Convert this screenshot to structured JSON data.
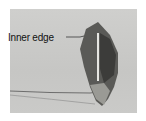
{
  "image": {
    "subject": "fabric piece folded into pointed shape with stitched seam",
    "annotation": {
      "label": "Inner edge"
    },
    "colors": {
      "background": "#c9c9c7",
      "fabric_dark": "#4a4a48",
      "fabric_light": "#8e8e8a",
      "seam": "#e8e8e4",
      "thread": "#5a5a58"
    }
  }
}
